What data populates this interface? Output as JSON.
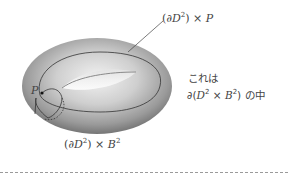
{
  "figure": {
    "type": "torus-diagram",
    "labels": {
      "top_curve": {
        "prefix": "(∂",
        "var": "D",
        "sup": "2",
        "suffix": ") × ",
        "var2": "P"
      },
      "bottom_curve": {
        "prefix": "(∂",
        "var": "D",
        "sup": "2",
        "suffix": ") × ",
        "var2": "B",
        "sup2": "2"
      },
      "point": "P"
    },
    "note": {
      "line1": "これは",
      "line2_prefix": "∂(",
      "line2_var1": "D",
      "line2_sup1": "2",
      "line2_mid": " × ",
      "line2_var2": "B",
      "line2_sup2": "2",
      "line2_suffix": ") の中"
    },
    "colors": {
      "torus_light": "#e6e6e6",
      "torus_dark": "#7a7a7a",
      "curve": "#333333",
      "divider": "#9a9a9a"
    }
  }
}
